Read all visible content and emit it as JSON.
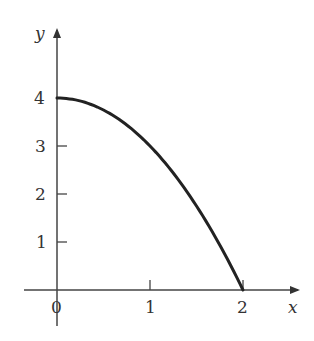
{
  "chart_data": {
    "type": "line",
    "title": "",
    "xlabel": "x",
    "ylabel": "y",
    "x_ticks": [
      "0",
      "1",
      "2"
    ],
    "y_ticks": [
      "1",
      "2",
      "3",
      "4"
    ],
    "xlim": [
      -0.3,
      2.6
    ],
    "ylim": [
      -0.7,
      4.9
    ],
    "grid": false,
    "legend": null,
    "series": [
      {
        "name": "y = 4 - x^2",
        "x": [
          0,
          0.25,
          0.5,
          0.75,
          1.0,
          1.25,
          1.5,
          1.75,
          2.0
        ],
        "y": [
          4,
          3.9375,
          3.75,
          3.4375,
          3.0,
          2.4375,
          1.75,
          0.9375,
          0
        ]
      }
    ],
    "colors": {
      "curve": "#222222",
      "axis": "#444444",
      "text": "#333333"
    }
  }
}
